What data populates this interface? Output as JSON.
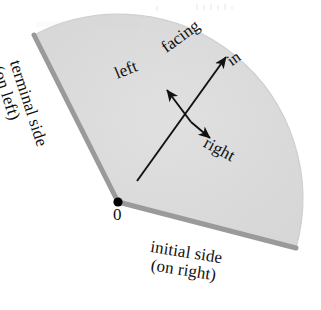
{
  "figure": {
    "kind": "geometry-diagram",
    "background_color": "#ffffff"
  },
  "sector": {
    "fill_color": "#dcdcdc",
    "edge_color": "#9a9a9a",
    "vertex_dot_color": "#000000",
    "vertex_label": "0",
    "vertex_point": [
      118,
      202
    ],
    "initial_side_end": [
      296,
      248
    ],
    "terminal_side_end": [
      34,
      35
    ],
    "arc_radius": 184
  },
  "labels": {
    "vertex": "0",
    "facing": "facing",
    "in": "in",
    "left": "left",
    "right": "right",
    "terminal_side_line1": "terminal side",
    "terminal_side_line2": "(on left)",
    "initial_side_line1": "initial side",
    "initial_side_line2": "(on right)"
  },
  "arrows": {
    "color": "#111111",
    "facing_in": {
      "name": "facing-in-arrow",
      "from": [
        137,
        181
      ],
      "to": [
        229,
        53
      ]
    },
    "left": {
      "name": "left-arrow",
      "from": [
        191,
        122
      ],
      "to": [
        164,
        87
      ]
    },
    "right": {
      "name": "right-arrow",
      "from": [
        191,
        122
      ],
      "to": [
        213,
        141
      ]
    }
  }
}
